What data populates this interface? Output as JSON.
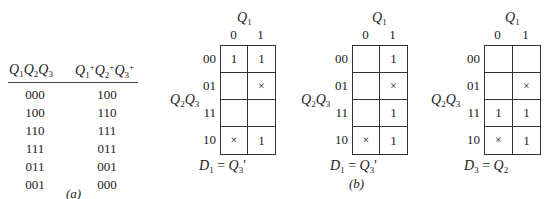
{
  "part_a": {
    "header_left": [
      "Q",
      "1",
      "Q",
      "2",
      "Q",
      "3"
    ],
    "header_right": [
      "Q",
      "1",
      "+",
      "Q",
      "2",
      "+",
      "Q",
      "3",
      "+"
    ],
    "present_states": [
      "000",
      "100",
      "110",
      "111",
      "011",
      "001"
    ],
    "next_states": [
      "100",
      "110",
      "111",
      "011",
      "001",
      "000"
    ],
    "caption": "(a)"
  },
  "part_b": {
    "caption": "(b)",
    "kmaps": [
      {
        "col_var": "Q1",
        "row_var": "Q2Q3",
        "col_labels": [
          "0",
          "1"
        ],
        "row_labels": [
          "00",
          "01",
          "11",
          "10"
        ],
        "cells": [
          [
            "1",
            "1"
          ],
          [
            "",
            "×"
          ],
          [
            "",
            ""
          ],
          [
            "×",
            "1"
          ]
        ],
        "equation": {
          "lhs": "D",
          "lhs_sub": "1",
          "rhs": "Q",
          "rhs_sub": "3",
          "rhs_suffix": "'"
        }
      },
      {
        "col_var": "Q1",
        "row_var": "Q2Q3",
        "col_labels": [
          "0",
          "1"
        ],
        "row_labels": [
          "00",
          "01",
          "11",
          "10"
        ],
        "cells": [
          [
            "",
            "1"
          ],
          [
            "",
            "×"
          ],
          [
            "",
            "1"
          ],
          [
            "×",
            "1"
          ]
        ],
        "equation": {
          "lhs": "D",
          "lhs_sub": "1",
          "rhs": "Q",
          "rhs_sub": "3",
          "rhs_suffix": "'"
        }
      },
      {
        "col_var": "Q1",
        "row_var": "Q2Q3",
        "col_labels": [
          "0",
          "1"
        ],
        "row_labels": [
          "00",
          "01",
          "11",
          "10"
        ],
        "cells": [
          [
            "",
            ""
          ],
          [
            "",
            "×"
          ],
          [
            "1",
            "1"
          ],
          [
            "×",
            "1"
          ]
        ],
        "equation": {
          "lhs": "D",
          "lhs_sub": "3",
          "rhs": "Q",
          "rhs_sub": "2",
          "rhs_suffix": ""
        }
      }
    ]
  }
}
